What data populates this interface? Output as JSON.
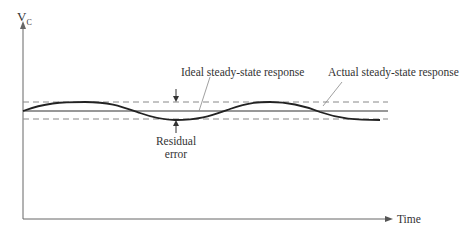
{
  "diagram": {
    "y_axis_label": "V",
    "y_axis_subscript": "C",
    "x_axis_label": "Time",
    "annotations": {
      "ideal": "Ideal steady-state response",
      "actual": "Actual steady-state response",
      "residual_line1": "Residual",
      "residual_line2": "error"
    },
    "colors": {
      "axis": "#555555",
      "curve": "#222222",
      "dashed": "#888888"
    }
  }
}
